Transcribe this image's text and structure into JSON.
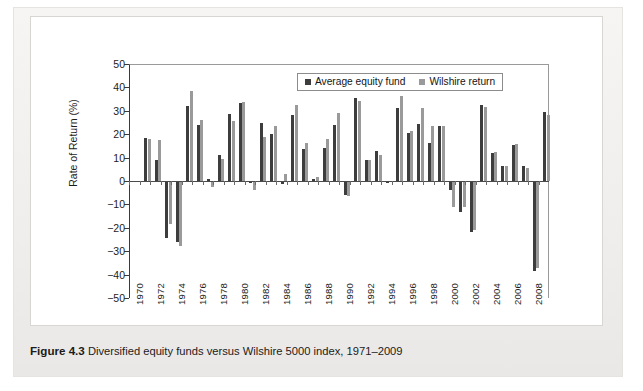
{
  "caption": {
    "label": "Figure 4.3",
    "text": "Diversified equity funds versus Wilshire 5000 index, 1971–2009"
  },
  "colors": {
    "series_dark": "#3d3d3d",
    "series_light": "#9a9a9a",
    "axis": "#3a3a3a",
    "panel_background": "#ffffff",
    "page_background": "#f3f2f0"
  },
  "chart_data": {
    "type": "bar",
    "title": "",
    "xlabel": "",
    "ylabel": "Rate of Return (%)",
    "ylim": [
      -50,
      50
    ],
    "yticks": [
      50,
      40,
      30,
      20,
      10,
      0,
      -10,
      -20,
      -30,
      -40,
      -50
    ],
    "ytick_labels": [
      "50",
      "40",
      "30",
      "20",
      "10",
      "0",
      "−10",
      "−20",
      "−30",
      "−40",
      "−50"
    ],
    "grid": false,
    "legend_position": "top-center",
    "xtick_labels": [
      "1970",
      "1972",
      "1974",
      "1976",
      "1978",
      "1980",
      "1982",
      "1984",
      "1986",
      "1988",
      "1990",
      "1992",
      "1994",
      "1996",
      "1998",
      "2000",
      "2002",
      "2004",
      "2006",
      "2008"
    ],
    "x": [
      1971,
      1972,
      1973,
      1974,
      1975,
      1976,
      1977,
      1978,
      1979,
      1980,
      1981,
      1982,
      1983,
      1984,
      1985,
      1986,
      1987,
      1988,
      1989,
      1990,
      1991,
      1992,
      1993,
      1994,
      1995,
      1996,
      1997,
      1998,
      1999,
      2000,
      2001,
      2002,
      2003,
      2004,
      2005,
      2006,
      2007,
      2008,
      2009
    ],
    "series": [
      {
        "name": "Average equity fund",
        "color": "#3d3d3d",
        "values": [
          18.3,
          9.0,
          -24.2,
          -26.1,
          32.0,
          24.1,
          0.9,
          10.9,
          28.6,
          33.4,
          -0.7,
          24.9,
          20.0,
          -1.3,
          28.2,
          13.8,
          0.8,
          14.3,
          23.8,
          -5.9,
          35.4,
          9.1,
          13.0,
          -0.8,
          31.2,
          20.4,
          24.2,
          16.2,
          23.4,
          -4.0,
          -13.2,
          -22.0,
          32.4,
          12.0,
          6.5,
          15.5,
          6.3,
          -38.6,
          29.4
        ]
      },
      {
        "name": "Wilshire return",
        "color": "#9a9a9a",
        "values": [
          17.8,
          17.5,
          -18.5,
          -27.8,
          38.5,
          26.1,
          -2.6,
          9.3,
          25.6,
          33.7,
          -3.7,
          18.7,
          23.5,
          3.0,
          32.6,
          16.1,
          1.8,
          17.9,
          29.2,
          -6.2,
          34.2,
          8.9,
          11.3,
          -0.1,
          36.4,
          21.2,
          31.3,
          23.4,
          23.6,
          -10.9,
          -11.0,
          -20.9,
          31.6,
          12.5,
          6.4,
          15.8,
          5.6,
          -37.2,
          28.3
        ]
      }
    ]
  },
  "legend": {
    "entries": [
      {
        "label": "Average equity fund",
        "swatch": "series_dark"
      },
      {
        "label": "Wilshire return",
        "swatch": "series_light"
      }
    ]
  }
}
